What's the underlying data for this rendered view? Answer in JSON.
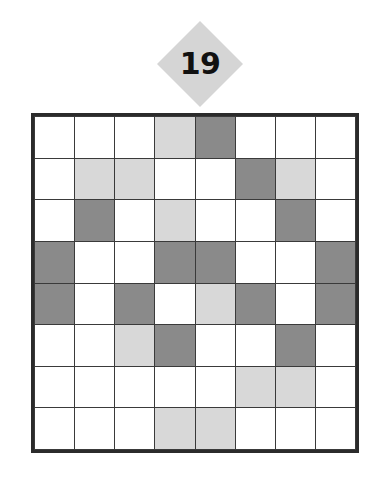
{
  "page": {
    "background_color": "#ffffff"
  },
  "badge": {
    "shape": "diamond",
    "number": "19",
    "fill_color": "#d5d5d5",
    "text_color": "#111111"
  },
  "grid": {
    "rows": 8,
    "columns": 8,
    "border_color": "#2b2b2b",
    "line_color": "#3a3a3a",
    "palette": {
      "white": "#ffffff",
      "light": "#d8d8d8",
      "dark": "#8a8a8a"
    },
    "cells": [
      [
        "white",
        "white",
        "white",
        "light",
        "dark",
        "white",
        "white",
        "white"
      ],
      [
        "white",
        "light",
        "light",
        "white",
        "white",
        "dark",
        "light",
        "white"
      ],
      [
        "white",
        "dark",
        "white",
        "light",
        "white",
        "white",
        "dark",
        "white"
      ],
      [
        "dark",
        "white",
        "white",
        "dark",
        "dark",
        "white",
        "white",
        "dark"
      ],
      [
        "dark",
        "white",
        "dark",
        "white",
        "light",
        "dark",
        "white",
        "dark"
      ],
      [
        "white",
        "white",
        "light",
        "dark",
        "white",
        "white",
        "dark",
        "white"
      ],
      [
        "white",
        "white",
        "white",
        "white",
        "white",
        "light",
        "light",
        "white"
      ],
      [
        "white",
        "white",
        "white",
        "light",
        "light",
        "white",
        "white",
        "white"
      ]
    ]
  }
}
